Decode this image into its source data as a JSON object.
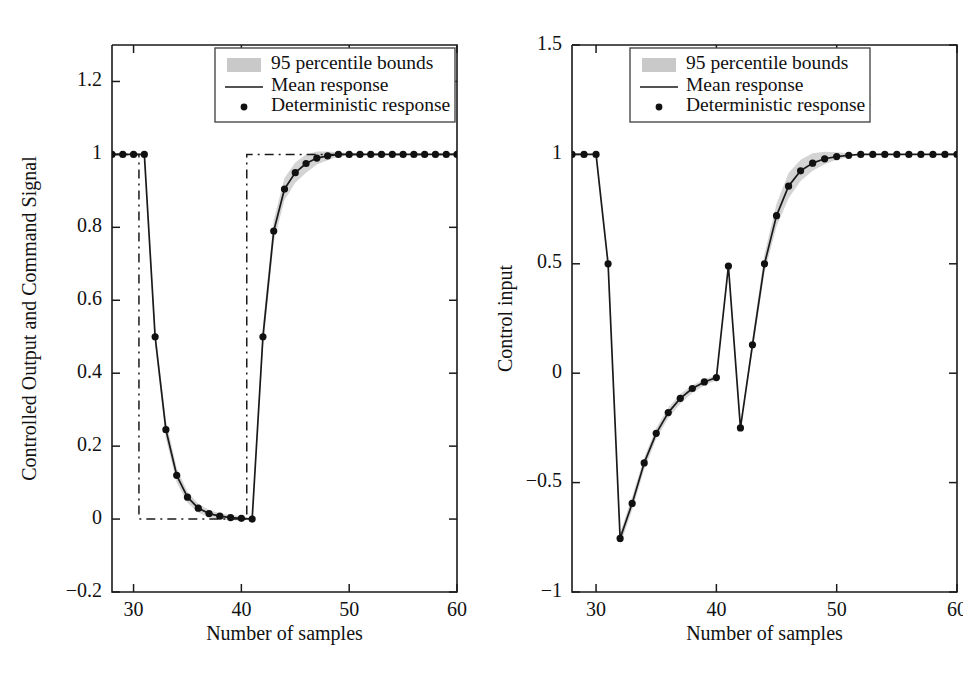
{
  "figure": {
    "panels": [
      {
        "id": "left",
        "ylabel": "Controlled Output and Command Signal",
        "xlabel": "Number of samples"
      },
      {
        "id": "right",
        "ylabel": "Control input",
        "xlabel": "Number of samples"
      }
    ],
    "legend": {
      "items": [
        {
          "label": "95 percentile bounds",
          "marker": "band-swatch"
        },
        {
          "label": "Mean response",
          "marker": "line"
        },
        {
          "label": "Deterministic response",
          "marker": "dot"
        }
      ]
    },
    "colors": {
      "line": "#1a1a1a",
      "band": "#b9b9b9",
      "marker": "#111111",
      "background": "#ffffff"
    }
  },
  "chart_data": [
    {
      "type": "line",
      "panel": "left",
      "title": "",
      "xlabel": "Number of samples",
      "ylabel": "Controlled Output and Command Signal",
      "xlim": [
        28,
        60
      ],
      "ylim": [
        -0.2,
        1.3
      ],
      "xticks": [
        30,
        40,
        50,
        60
      ],
      "yticks": [
        -0.2,
        0,
        0.2,
        0.4,
        0.6,
        0.8,
        1,
        1.2
      ],
      "grid": false,
      "legend_position": "top-right",
      "x": [
        28,
        29,
        30,
        31,
        32,
        33,
        34,
        35,
        36,
        37,
        38,
        39,
        40,
        41,
        42,
        43,
        44,
        45,
        46,
        47,
        48,
        49,
        50,
        51,
        52,
        53,
        54,
        55,
        56,
        57,
        58,
        59,
        60
      ],
      "series": [
        {
          "name": "Mean response",
          "values": [
            1,
            1,
            1,
            1,
            0.5,
            0.245,
            0.12,
            0.06,
            0.03,
            0.015,
            0.008,
            0.004,
            0.002,
            0.0,
            0.5,
            0.79,
            0.905,
            0.95,
            0.975,
            0.99,
            0.996,
            1,
            1,
            1,
            1,
            1,
            1,
            1,
            1,
            1,
            1,
            1,
            1
          ]
        },
        {
          "name": "Deterministic response",
          "values": [
            1,
            1,
            1,
            1,
            0.5,
            0.245,
            0.12,
            0.06,
            0.03,
            0.015,
            0.008,
            0.004,
            0.002,
            0.0,
            0.5,
            0.79,
            0.905,
            0.95,
            0.975,
            0.99,
            0.996,
            1,
            1,
            1,
            1,
            1,
            1,
            1,
            1,
            1,
            1,
            1,
            1
          ]
        },
        {
          "name": "95 percentile upper bound",
          "values": [
            1,
            1,
            1,
            1,
            0.52,
            0.27,
            0.14,
            0.075,
            0.042,
            0.025,
            0.016,
            0.011,
            0.008,
            0.0,
            0.53,
            0.82,
            0.935,
            0.978,
            1.0,
            1.008,
            1.008,
            1.006,
            1.004,
            1.002,
            1,
            1,
            1,
            1,
            1,
            1,
            1,
            1,
            1
          ]
        },
        {
          "name": "95 percentile lower bound",
          "values": [
            1,
            1,
            1,
            1,
            0.48,
            0.22,
            0.1,
            0.045,
            0.018,
            0.005,
            0.0,
            -0.003,
            -0.004,
            0.0,
            0.47,
            0.76,
            0.875,
            0.922,
            0.95,
            0.972,
            0.984,
            0.994,
            0.996,
            0.998,
            1,
            1,
            1,
            1,
            1,
            1,
            1,
            1,
            1
          ]
        },
        {
          "name": "Command signal",
          "values": [
            1,
            1,
            1,
            0,
            0,
            0,
            0,
            0,
            0,
            0,
            0,
            0,
            0,
            1,
            1,
            1,
            1,
            1,
            1,
            1,
            1,
            1,
            1,
            1,
            1,
            1,
            1,
            1,
            1,
            1,
            1,
            1,
            1
          ]
        }
      ]
    },
    {
      "type": "line",
      "panel": "right",
      "title": "",
      "xlabel": "Number of samples",
      "ylabel": "Control input",
      "xlim": [
        28,
        60
      ],
      "ylim": [
        -1,
        1.5
      ],
      "xticks": [
        30,
        40,
        50,
        60
      ],
      "yticks": [
        -1,
        -0.5,
        0,
        0.5,
        1,
        1.5
      ],
      "grid": false,
      "legend_position": "top-right",
      "x": [
        28,
        29,
        30,
        31,
        32,
        33,
        34,
        35,
        36,
        37,
        38,
        39,
        40,
        41,
        42,
        43,
        44,
        45,
        46,
        47,
        48,
        49,
        50,
        51,
        52,
        53,
        54,
        55,
        56,
        57,
        58,
        59,
        60
      ],
      "series": [
        {
          "name": "Mean response",
          "values": [
            1,
            1,
            1,
            0.5,
            -0.755,
            -0.595,
            -0.41,
            -0.275,
            -0.18,
            -0.115,
            -0.07,
            -0.04,
            -0.02,
            0.49,
            -0.25,
            0.13,
            0.5,
            0.72,
            0.855,
            0.925,
            0.96,
            0.98,
            0.99,
            0.996,
            1,
            1,
            1,
            1,
            1,
            1,
            1,
            1,
            1
          ]
        },
        {
          "name": "Deterministic response",
          "values": [
            1,
            1,
            1,
            0.5,
            -0.755,
            -0.595,
            -0.41,
            -0.275,
            -0.18,
            -0.115,
            -0.07,
            -0.04,
            -0.02,
            0.49,
            -0.25,
            0.13,
            0.5,
            0.72,
            0.855,
            0.925,
            0.96,
            0.98,
            0.99,
            0.996,
            1,
            1,
            1,
            1,
            1,
            1,
            1,
            1,
            1
          ]
        },
        {
          "name": "95 percentile upper bound",
          "values": [
            1,
            1,
            1,
            0.5,
            -0.73,
            -0.565,
            -0.385,
            -0.25,
            -0.158,
            -0.095,
            -0.055,
            -0.028,
            -0.01,
            0.49,
            -0.25,
            0.16,
            0.545,
            0.775,
            0.915,
            0.975,
            1.005,
            1.012,
            1.01,
            1.005,
            1,
            1,
            1,
            1,
            1,
            1,
            1,
            1,
            1
          ]
        },
        {
          "name": "95 percentile lower bound",
          "values": [
            1,
            1,
            1,
            0.5,
            -0.785,
            -0.625,
            -0.44,
            -0.3,
            -0.205,
            -0.14,
            -0.09,
            -0.055,
            -0.032,
            0.49,
            -0.25,
            0.1,
            0.46,
            0.67,
            0.8,
            0.878,
            0.925,
            0.955,
            0.975,
            0.988,
            1,
            1,
            1,
            1,
            1,
            1,
            1,
            1,
            1
          ]
        }
      ]
    }
  ]
}
